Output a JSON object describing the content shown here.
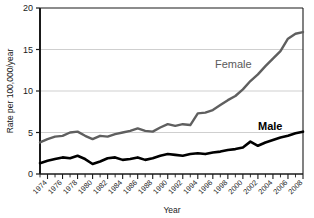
{
  "chart_data": {
    "type": "line",
    "title": "",
    "xlabel": "Year",
    "ylabel": "Rate per 100,000/year",
    "xlim": [
      1973,
      2008
    ],
    "ylim": [
      0,
      20
    ],
    "yticks": [
      0,
      5,
      10,
      15,
      20
    ],
    "ytick_labels": [
      "0",
      "5",
      "10",
      "15",
      "20"
    ],
    "xticks": [
      1974,
      1976,
      1978,
      1980,
      1982,
      1984,
      1986,
      1988,
      1990,
      1992,
      1994,
      1996,
      1998,
      2000,
      2002,
      2004,
      2006,
      2008
    ],
    "xtick_labels": [
      "1974",
      "1976",
      "1978",
      "1980",
      "1982",
      "1984",
      "1986",
      "1988",
      "1990",
      "1992",
      "1994",
      "1996",
      "1998",
      "2000",
      "2002",
      "2004",
      "2006",
      "2008"
    ],
    "minor_xticks_every": 1,
    "grid": "horizontal",
    "legend": "inline-annotations",
    "x": [
      1973,
      1974,
      1975,
      1976,
      1977,
      1978,
      1979,
      1980,
      1981,
      1982,
      1983,
      1984,
      1985,
      1986,
      1987,
      1988,
      1989,
      1990,
      1991,
      1992,
      1993,
      1994,
      1995,
      1996,
      1997,
      1998,
      1999,
      2000,
      2001,
      2002,
      2003,
      2004,
      2005,
      2006,
      2007,
      2008
    ],
    "series": [
      {
        "name": "Female",
        "color": "#5f5f5f",
        "label_text": "Female",
        "values": [
          3.8,
          4.2,
          4.5,
          4.6,
          5.0,
          5.1,
          4.6,
          4.2,
          4.6,
          4.5,
          4.8,
          5.0,
          5.2,
          5.5,
          5.2,
          5.1,
          5.6,
          6.0,
          5.8,
          6.0,
          5.9,
          7.3,
          7.4,
          7.7,
          8.3,
          8.9,
          9.4,
          10.2,
          11.2,
          12.0,
          13.0,
          13.9,
          14.8,
          16.3,
          16.9,
          17.1
        ]
      },
      {
        "name": "Male",
        "color": "#000000",
        "label_text": "Male",
        "values": [
          1.3,
          1.6,
          1.8,
          2.0,
          1.9,
          2.2,
          1.8,
          1.2,
          1.5,
          1.9,
          2.0,
          1.7,
          1.8,
          2.0,
          1.7,
          1.9,
          2.2,
          2.4,
          2.3,
          2.2,
          2.4,
          2.5,
          2.4,
          2.6,
          2.7,
          2.9,
          3.0,
          3.2,
          3.9,
          3.4,
          3.8,
          4.1,
          4.4,
          4.6,
          4.9,
          5.1
        ]
      }
    ],
    "annotations": [
      {
        "text": "Female",
        "x_px": 215,
        "y_px": 64,
        "color": "#5f5f5f"
      },
      {
        "text": "Male",
        "x_px": 258,
        "y_px": 128,
        "color": "#000000"
      }
    ]
  }
}
